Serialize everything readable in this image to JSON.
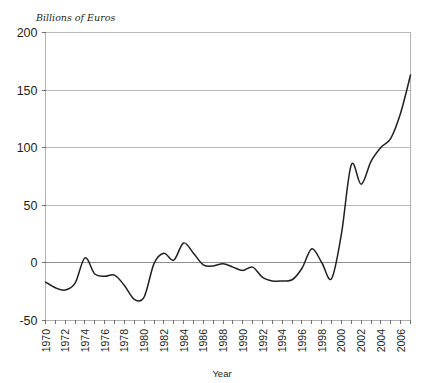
{
  "chart_data": {
    "type": "line",
    "title": "",
    "subtitle": "",
    "xlabel": "Year",
    "ylabel": "Billions of Euros",
    "ylim": [
      -50,
      200
    ],
    "xlim": [
      1970,
      2007
    ],
    "yticks": [
      200,
      150,
      100,
      50,
      0,
      -50
    ],
    "ytick_labels": [
      "200",
      "150",
      "100",
      "50",
      "0",
      "-50"
    ],
    "xticks": [
      1970,
      1971,
      1972,
      1973,
      1974,
      1975,
      1976,
      1977,
      1978,
      1979,
      1980,
      1981,
      1982,
      1983,
      1984,
      1985,
      1986,
      1987,
      1988,
      1989,
      1990,
      1991,
      1992,
      1993,
      1994,
      1995,
      1996,
      1997,
      1998,
      1999,
      2000,
      2001,
      2002,
      2003,
      2004,
      2005,
      2006,
      2007
    ],
    "xtick_labels": [
      "1970",
      "",
      "1972",
      "",
      "1974",
      "",
      "1976",
      "",
      "1978",
      "",
      "1980",
      "",
      "1982",
      "",
      "1984",
      "",
      "1986",
      "",
      "1988",
      "",
      "1990",
      "",
      "1992",
      "",
      "1994",
      "",
      "1996",
      "",
      "1998",
      "",
      "2000",
      "",
      "2002",
      "",
      "2004",
      "",
      "2006",
      ""
    ],
    "xtick_label_rotation": -90,
    "grid": true,
    "grid_axis": "y",
    "legend": false,
    "legend_position": "none",
    "line_color": "#231f20",
    "grid_color": "#b9b9b9",
    "zero_line_color": "#8d8d8d",
    "x": [
      1970,
      1971,
      1972,
      1973,
      1974,
      1975,
      1976,
      1977,
      1978,
      1979,
      1980,
      1981,
      1982,
      1983,
      1984,
      1985,
      1986,
      1987,
      1988,
      1989,
      1990,
      1991,
      1992,
      1993,
      1994,
      1995,
      1996,
      1997,
      1998,
      1999,
      2000,
      2001,
      2002,
      2003,
      2004,
      2005,
      2006,
      2007
    ],
    "values": [
      -17,
      -22,
      -24,
      -18,
      4,
      -10,
      -12,
      -11,
      -20,
      -32,
      -30,
      -1,
      8,
      2,
      17,
      8,
      -2,
      -3,
      -1,
      -4,
      -7,
      -4,
      -13,
      -16,
      -16,
      -15,
      -5,
      12,
      0,
      -14,
      25,
      85,
      68,
      88,
      100,
      108,
      130,
      163
    ],
    "series": [
      {
        "name": "Billions of Euros",
        "values": [
          -17,
          -22,
          -24,
          -18,
          4,
          -10,
          -12,
          -11,
          -20,
          -32,
          -30,
          -1,
          8,
          2,
          17,
          8,
          -2,
          -3,
          -1,
          -4,
          -7,
          -4,
          -13,
          -16,
          -16,
          -15,
          -5,
          12,
          0,
          -14,
          25,
          85,
          68,
          88,
          100,
          108,
          130,
          163
        ]
      }
    ]
  }
}
